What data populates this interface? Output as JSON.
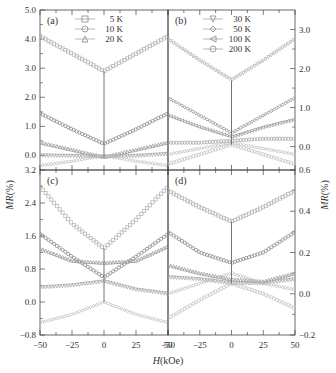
{
  "figure": {
    "xlabel_italic": "H",
    "xlabel_rest": "(kOe)",
    "ylabel_italic": "MR",
    "ylabel_rest": "(%)"
  },
  "chart_data": [
    {
      "panel": "(a)",
      "type": "line",
      "xlim": [
        -50,
        50
      ],
      "ylim": [
        -0.5,
        5.0
      ],
      "yticks": [
        "5.0",
        "4.0",
        "3.0",
        "2.0",
        "1.0",
        "0.0"
      ],
      "ytick_values": [
        5.0,
        4.0,
        3.0,
        2.0,
        1.0,
        0.0
      ],
      "yaxis_side": "left",
      "legend": [
        {
          "marker": "square",
          "label": "5 K"
        },
        {
          "marker": "circle",
          "label": "10 K"
        },
        {
          "marker": "triangle-up",
          "label": "20 K"
        }
      ],
      "series": [
        {
          "name": "5 K",
          "x": [
            -50,
            -25,
            0,
            25,
            50
          ],
          "y": [
            4.1,
            3.5,
            2.9,
            3.5,
            4.1
          ]
        },
        {
          "name": "10 K",
          "x": [
            -50,
            -25,
            0,
            25,
            50
          ],
          "y": [
            1.45,
            0.9,
            0.4,
            0.9,
            1.45
          ]
        },
        {
          "name": "20 K",
          "x": [
            -50,
            -25,
            0,
            25,
            50
          ],
          "y": [
            0.45,
            0.2,
            -0.05,
            0.2,
            0.45
          ]
        },
        {
          "name": "curve-4",
          "x": [
            -50,
            -25,
            0,
            25,
            50
          ],
          "y": [
            0.0,
            -0.02,
            -0.05,
            -0.02,
            0.05
          ]
        },
        {
          "name": "curve-5",
          "x": [
            -50,
            -25,
            0,
            25,
            50
          ],
          "y": [
            -0.35,
            -0.2,
            0.0,
            -0.2,
            -0.35
          ]
        }
      ]
    },
    {
      "panel": "(b)",
      "type": "line",
      "xlim": [
        -50,
        50
      ],
      "ylim": [
        -0.6,
        3.5
      ],
      "yticks": [
        "3.0",
        "2.0",
        "1.0",
        "0.0"
      ],
      "ytick_values": [
        3.0,
        2.0,
        1.0,
        0.0
      ],
      "yaxis_side": "right",
      "legend": [
        {
          "marker": "triangle-down",
          "label": "30 K"
        },
        {
          "marker": "diamond",
          "label": "50 K"
        },
        {
          "marker": "triangle-left",
          "label": "100 K"
        },
        {
          "marker": "circle",
          "label": "200 K"
        }
      ],
      "series": [
        {
          "name": "30 K",
          "x": [
            -50,
            -25,
            0,
            25,
            50
          ],
          "y": [
            2.75,
            2.2,
            1.7,
            2.2,
            2.75
          ]
        },
        {
          "name": "50 K",
          "x": [
            -50,
            -25,
            0,
            25,
            50
          ],
          "y": [
            1.25,
            0.8,
            0.35,
            0.8,
            1.25
          ]
        },
        {
          "name": "100 K",
          "x": [
            -50,
            -25,
            0,
            25,
            50
          ],
          "y": [
            0.8,
            0.5,
            0.25,
            0.5,
            0.7
          ]
        },
        {
          "name": "200 K",
          "x": [
            -50,
            -25,
            0,
            25,
            50
          ],
          "y": [
            0.1,
            0.1,
            0.15,
            0.2,
            0.2
          ]
        },
        {
          "name": "curve-5",
          "x": [
            -50,
            -25,
            0,
            25,
            50
          ],
          "y": [
            -0.2,
            -0.05,
            0.1,
            -0.05,
            -0.2
          ]
        },
        {
          "name": "curve-6",
          "x": [
            -50,
            -25,
            0,
            25,
            50
          ],
          "y": [
            -0.45,
            -0.2,
            0.05,
            -0.2,
            -0.45
          ]
        }
      ]
    },
    {
      "panel": "(c)",
      "type": "line",
      "xlim": [
        -50,
        50
      ],
      "ylim": [
        -0.8,
        3.2
      ],
      "xticks": [
        "-50",
        "-25",
        "0",
        "25",
        "50"
      ],
      "yticks": [
        "3.2",
        "2.4",
        "1.6",
        "0.8",
        "0.0",
        "-0.8"
      ],
      "ytick_values": [
        3.2,
        2.4,
        1.6,
        0.8,
        0.0,
        -0.8
      ],
      "yaxis_side": "left",
      "series": [
        {
          "name": "curve-1",
          "x": [
            -50,
            -25,
            0,
            25,
            50
          ],
          "y": [
            2.8,
            1.9,
            1.3,
            2.0,
            2.8
          ]
        },
        {
          "name": "curve-2",
          "x": [
            -50,
            -25,
            0,
            25,
            50
          ],
          "y": [
            1.65,
            1.1,
            0.6,
            1.1,
            1.65
          ]
        },
        {
          "name": "curve-3",
          "x": [
            -50,
            -25,
            0,
            25,
            50
          ],
          "y": [
            1.3,
            1.0,
            0.95,
            1.0,
            1.35
          ]
        },
        {
          "name": "curve-4",
          "x": [
            -50,
            -25,
            0,
            25,
            50
          ],
          "y": [
            0.35,
            0.4,
            0.5,
            0.3,
            0.2
          ]
        },
        {
          "name": "curve-5",
          "x": [
            -50,
            -25,
            0,
            25,
            50
          ],
          "y": [
            -0.5,
            -0.3,
            0.0,
            -0.3,
            -0.5
          ]
        }
      ]
    },
    {
      "panel": "(d)",
      "type": "line",
      "xlim": [
        -50,
        50
      ],
      "ylim": [
        -0.2,
        0.6
      ],
      "xticks": [
        "-50",
        "-25",
        "0",
        "25",
        "50"
      ],
      "yticks": [
        "0.6",
        "0.4",
        "0.2",
        "0.0",
        "-0.2"
      ],
      "ytick_values": [
        0.6,
        0.4,
        0.2,
        0.0,
        -0.2
      ],
      "yaxis_side": "right",
      "series": [
        {
          "name": "curve-1",
          "x": [
            -50,
            -25,
            0,
            25,
            50
          ],
          "y": [
            0.5,
            0.42,
            0.35,
            0.42,
            0.5
          ]
        },
        {
          "name": "curve-2",
          "x": [
            -50,
            -25,
            0,
            25,
            50
          ],
          "y": [
            0.3,
            0.2,
            0.15,
            0.2,
            0.3
          ]
        },
        {
          "name": "curve-3",
          "x": [
            -50,
            -25,
            0,
            25,
            50
          ],
          "y": [
            0.14,
            0.1,
            0.07,
            0.06,
            0.1
          ]
        },
        {
          "name": "curve-4",
          "x": [
            -50,
            -25,
            0,
            25,
            50
          ],
          "y": [
            0.08,
            0.07,
            0.05,
            0.05,
            0.07
          ]
        },
        {
          "name": "curve-5",
          "x": [
            -50,
            -25,
            0,
            25,
            50
          ],
          "y": [
            0.0,
            0.05,
            0.1,
            0.05,
            0.02
          ]
        },
        {
          "name": "curve-6",
          "x": [
            -50,
            -25,
            0,
            25,
            50
          ],
          "y": [
            -0.12,
            -0.03,
            0.05,
            0.0,
            -0.07
          ]
        }
      ]
    }
  ]
}
